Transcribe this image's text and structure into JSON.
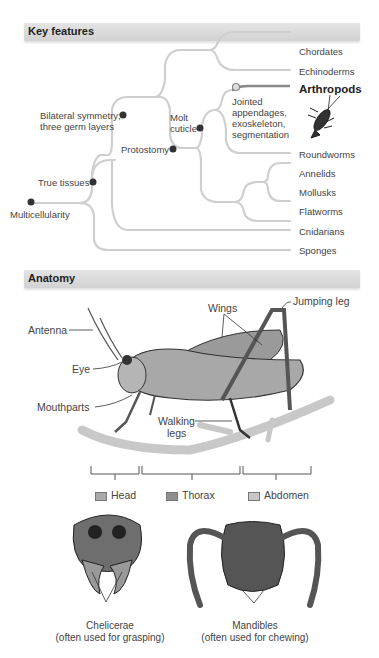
{
  "sections": {
    "key_features": {
      "title": "Key features"
    },
    "anatomy": {
      "title": "Anatomy"
    }
  },
  "tree": {
    "nodes": {
      "multicellularity": "Multicellularity",
      "true_tissues": "True tissues",
      "bilateral": [
        "Bilateral symmetry;",
        "three germ layers"
      ],
      "protostomy": "Protostomy",
      "molt": [
        "Molt",
        "cuticle"
      ],
      "jointed": [
        "Jointed",
        "appendages,",
        "exoskeleton,",
        "segmentation"
      ]
    },
    "taxa": [
      "Chordates",
      "Echinoderms",
      "Arthropods",
      "Roundworms",
      "Annelids",
      "Mollusks",
      "Flatworms",
      "Cnidarians",
      "Sponges"
    ],
    "highlight": "Arthropods",
    "colors": {
      "branch": "#cfcfcf",
      "highlight_branch": "#888888",
      "node": "#333333"
    }
  },
  "anatomy": {
    "labels": {
      "antenna": "Antenna",
      "eye": "Eye",
      "mouthparts": "Mouthparts",
      "wings": "Wings",
      "jumping_leg": "Jumping leg",
      "walking_legs": [
        "Walking",
        "legs"
      ]
    },
    "legend": [
      {
        "label": "Head",
        "color": "#a9a9a9"
      },
      {
        "label": "Thorax",
        "color": "#8f8f8f"
      },
      {
        "label": "Abdomen",
        "color": "#c8c8c8"
      }
    ],
    "mouthparts": [
      {
        "name": "Chelicerae",
        "desc": "(often used for grasping)"
      },
      {
        "name": "Mandibles",
        "desc": "(often used for chewing)"
      }
    ]
  }
}
